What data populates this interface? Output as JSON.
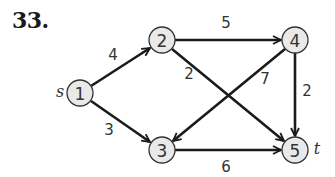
{
  "problem": {
    "number": "33."
  },
  "graph": {
    "directed": true,
    "source_label": "s",
    "sink_label": "t",
    "nodes": [
      {
        "id": "1",
        "label": "1",
        "x": 80,
        "y": 93
      },
      {
        "id": "2",
        "label": "2",
        "x": 162,
        "y": 40
      },
      {
        "id": "3",
        "label": "3",
        "x": 162,
        "y": 150
      },
      {
        "id": "4",
        "label": "4",
        "x": 295,
        "y": 40
      },
      {
        "id": "5",
        "label": "5",
        "x": 295,
        "y": 150
      }
    ],
    "edges": [
      {
        "from": "1",
        "to": "2",
        "weight": "4"
      },
      {
        "from": "1",
        "to": "3",
        "weight": "3"
      },
      {
        "from": "2",
        "to": "4",
        "weight": "5"
      },
      {
        "from": "2",
        "to": "5",
        "weight": "2"
      },
      {
        "from": "4",
        "to": "3",
        "weight": "7"
      },
      {
        "from": "4",
        "to": "5",
        "weight": "2"
      },
      {
        "from": "3",
        "to": "5",
        "weight": "6"
      }
    ]
  },
  "colors": {
    "node_fill": "#e9e9e9",
    "stroke": "#1a1a1a",
    "text": "#333333"
  }
}
